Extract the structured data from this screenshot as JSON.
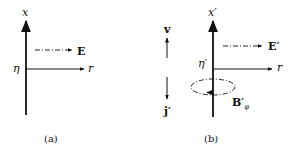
{
  "panels": [
    {
      "id": "a",
      "caption": "(a)",
      "vertical_axis_label": "x",
      "horizontal_axis_label": "r",
      "origin_label": "η",
      "field_vector_label": "E"
    },
    {
      "id": "b",
      "caption": "(b)",
      "vertical_axis_label": "x′",
      "horizontal_axis_label": "r",
      "origin_label": "η′",
      "field_vector_label": "E′",
      "velocity_label": "v",
      "current_label": "j′",
      "magnetic_field_label": "B′",
      "magnetic_field_subscript": "φ"
    }
  ],
  "colors": {
    "ink": "#111111",
    "background": "#ffffff"
  }
}
